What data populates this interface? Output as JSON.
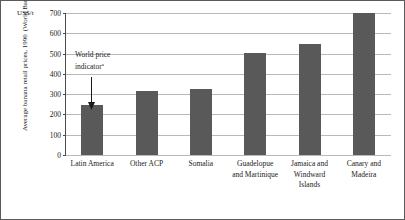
{
  "unit_label": "US$/t",
  "y_axis_title_line1": "Average banana retail prices, 1990",
  "y_axis_title_line2": "(World Bank estimates)",
  "annotation": {
    "line1": "World price",
    "line2": "indicator",
    "superscript": "a",
    "arrow_name": "annotation-arrow"
  },
  "colors": {
    "bar_fill": "#595959",
    "gridline": "#b9b9b9",
    "axis": "#4d4d4d",
    "border": "#5a5a5a",
    "text": "#1a1a1a"
  },
  "chart_data": {
    "type": "bar",
    "title": "",
    "subtitle": "",
    "xlabel": "",
    "ylabel": "Average banana retail prices, 1990 (World Bank estimates)",
    "unit": "US$/t",
    "ylim": [
      0,
      700
    ],
    "yticks": [
      0,
      100,
      200,
      300,
      400,
      500,
      600,
      700
    ],
    "ytick_labels": [
      "0",
      "100",
      "200",
      "300",
      "400",
      "500",
      "600",
      "700"
    ],
    "grid": true,
    "legend": "none",
    "categories": [
      "Latin America",
      "Other ACP",
      "Somalia",
      "Guadelopue and Martinique",
      "Jamaica and Windward Islands",
      "Canary and Madeira"
    ],
    "category_lines": [
      [
        "Latin America"
      ],
      [
        "Other ACP"
      ],
      [
        "Somalia"
      ],
      [
        "Guadelopue",
        "and Martinique"
      ],
      [
        "Jamaica and",
        "Windward",
        "Islands"
      ],
      [
        "Canary and",
        "Madeira"
      ]
    ],
    "values": [
      245,
      315,
      325,
      505,
      545,
      700
    ],
    "annotations": [
      {
        "text": "World price indicator a",
        "target_category": "Latin America",
        "target_value": 245
      }
    ]
  }
}
